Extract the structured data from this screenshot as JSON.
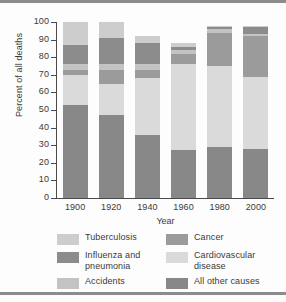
{
  "chart_data": {
    "type": "bar",
    "subtype": "stacked-bar-100",
    "title": "",
    "xlabel": "Year",
    "ylabel": "Percent of all deaths",
    "ylim": [
      0,
      100
    ],
    "yticks": [
      0,
      10,
      20,
      30,
      40,
      50,
      60,
      70,
      80,
      90,
      100
    ],
    "ytick_labels": [
      "0",
      "10",
      "20",
      "30",
      "40",
      "50",
      "60",
      "70",
      "80",
      "90",
      "100"
    ],
    "grid": false,
    "legend_position": "bottom",
    "categories": [
      "1900",
      "1920",
      "1940",
      "1960",
      "1980",
      "2000"
    ],
    "series": [
      {
        "name": "All other causes",
        "values": [
          53,
          47,
          36,
          27,
          29,
          28
        ]
      },
      {
        "name": "Cardiovascular disease",
        "values": [
          17,
          18,
          32,
          49,
          46,
          41
        ]
      },
      {
        "name": "Cancer",
        "values": [
          3,
          8,
          5,
          6,
          19,
          23
        ]
      },
      {
        "name": "Accidents",
        "values": [
          3,
          3,
          3,
          2,
          2,
          1
        ]
      },
      {
        "name": "Influenza and pneumonia",
        "values": [
          11,
          15,
          12,
          2,
          1,
          4
        ]
      },
      {
        "name": "Tuberculosis",
        "values": [
          13,
          9,
          4,
          2,
          1,
          1
        ]
      }
    ],
    "stack_order_bottom_to_top": [
      "All other causes",
      "Cardiovascular disease",
      "Cancer",
      "Accidents",
      "Influenza and pneumonia",
      "Tuberculosis"
    ],
    "colors": {
      "Tuberculosis": "#cdcdcd",
      "Influenza and pneumonia": "#8c8c8c",
      "Accidents": "#c3c3c3",
      "Cancer": "#9b9b9b",
      "Cardiovascular disease": "#dadada",
      "All other causes": "#888888"
    }
  },
  "legend": {
    "items": [
      {
        "label": "Tuberculosis",
        "color_key": "Tuberculosis"
      },
      {
        "label": "Cancer",
        "color_key": "Cancer"
      },
      {
        "label": "Influenza and\npneumonia",
        "color_key": "Influenza and pneumonia"
      },
      {
        "label": "Cardiovascular\ndisease",
        "color_key": "Cardiovascular disease"
      },
      {
        "label": "Accidents",
        "color_key": "Accidents"
      },
      {
        "label": "All other causes",
        "color_key": "All other causes"
      }
    ]
  }
}
